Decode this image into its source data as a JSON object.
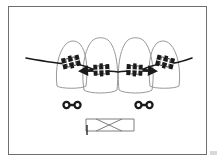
{
  "figure": {
    "domain_label": "orthodontic-diagram",
    "title": "",
    "caption": "",
    "frame": {
      "border_color": "#6f6f6f",
      "background": "#ffffff",
      "x": 8,
      "y": 6,
      "width": 199,
      "height": 149
    },
    "ink_color": "#1a1a1a",
    "outline_color": "#8c8c8c"
  },
  "dental_arch": {
    "label": "four-front-teeth-with-fixed-appliance",
    "tooth_count": 4,
    "teeth": [
      {
        "name": "lateral-incisor-left",
        "position": "outer-left",
        "cx": 71,
        "cy": 64,
        "half_width": 16,
        "crown_top": 41,
        "crown_bottom": 88,
        "size": "small"
      },
      {
        "name": "central-incisor-left",
        "position": "inner-left",
        "cx": 100,
        "cy": 64,
        "half_width": 18,
        "crown_top": 38,
        "crown_bottom": 92,
        "size": "large"
      },
      {
        "name": "central-incisor-right",
        "position": "inner-right",
        "cx": 136,
        "cy": 64,
        "half_width": 18,
        "crown_top": 38,
        "crown_bottom": 92,
        "size": "large"
      },
      {
        "name": "lateral-incisor-right",
        "position": "outer-right",
        "cx": 165,
        "cy": 64,
        "half_width": 16,
        "crown_top": 41,
        "crown_bottom": 88,
        "size": "small"
      }
    ]
  },
  "archwire": {
    "label": "continuous-archwire",
    "left_end_x": 26,
    "left_end_y": 58,
    "right_end_x": 192,
    "right_end_y": 58,
    "apex_y": 70,
    "stroke_width": 1.6
  },
  "brackets": [
    {
      "name": "bracket-lateral-left",
      "cx": 71,
      "cy": 62,
      "angle": -14,
      "has_arrow": false,
      "arrow_direction": "none"
    },
    {
      "name": "bracket-central-left",
      "cx": 100,
      "cy": 70,
      "angle": -3,
      "has_arrow": true,
      "arrow_direction": "left"
    },
    {
      "name": "bracket-central-right",
      "cx": 136,
      "cy": 70,
      "angle": 3,
      "has_arrow": true,
      "arrow_direction": "right"
    },
    {
      "name": "bracket-lateral-right",
      "cx": 165,
      "cy": 62,
      "angle": 14,
      "has_arrow": false,
      "arrow_direction": "none"
    }
  ],
  "force_arrows": {
    "label": "force-vectors-pointing-outward",
    "count": 2,
    "directions": [
      "left",
      "right"
    ]
  },
  "detail_items": [
    {
      "name": "dumbbell-left",
      "type": "open-coil-stop-pair",
      "cx": 72,
      "cy": 105,
      "ring_radius": 4.2,
      "ring_inner_radius": 1.9,
      "bar_length": 11,
      "bar_thickness": 2.4
    },
    {
      "name": "dumbbell-right",
      "type": "open-coil-stop-pair",
      "cx": 144,
      "cy": 105,
      "ring_radius": 4.2,
      "ring_inner_radius": 1.9,
      "bar_length": 11,
      "bar_thickness": 2.4
    }
  ],
  "twisted_element": {
    "name": "twisted-wire-segment",
    "type": "crossed-rectangle",
    "left_x": 86,
    "right_x": 134,
    "top_y": 119,
    "bottom_y": 131,
    "has_left_tick": true,
    "tick_x": 87,
    "tick_bottom_y": 135
  }
}
